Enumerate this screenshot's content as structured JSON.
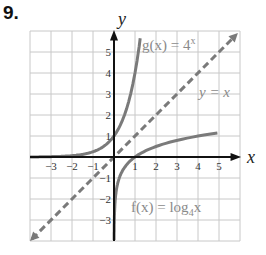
{
  "problem": {
    "number": "9."
  },
  "chart_data": {
    "type": "line",
    "title": "",
    "xlabel": "x",
    "ylabel": "y",
    "xlim": [
      -4,
      6
    ],
    "ylim": [
      -4,
      6
    ],
    "grid": true,
    "x_ticks": [
      "-3",
      "-2",
      "-1",
      "1",
      "2",
      "3",
      "4",
      "5"
    ],
    "y_ticks": [
      "5",
      "4",
      "3",
      "2",
      "1",
      "-1",
      "-2",
      "-3"
    ],
    "series": [
      {
        "name": "g(x) = 4^x",
        "style": "solid",
        "color": "#7a7a7a",
        "formula": "4^x"
      },
      {
        "name": "f(x) = log_4 x",
        "style": "solid",
        "color": "#7a7a7a",
        "formula": "log4(x)"
      },
      {
        "name": "y = x",
        "style": "dashed",
        "color": "#7a7a7a",
        "formula": "x"
      }
    ],
    "annotations": [
      {
        "text": "g(x) = 4^x",
        "position": "top-right"
      },
      {
        "text": "y = x",
        "position": "right"
      },
      {
        "text": "f(x) = log4x",
        "position": "bottom-right"
      }
    ]
  },
  "labels": {
    "x_axis": "x",
    "y_axis": "y",
    "g_label_prefix": "g(x) = 4",
    "g_label_exp": "x",
    "yx_label": "y = x",
    "f_label_prefix": "f(x) = log",
    "f_label_sub": "4",
    "f_label_suffix": "x"
  },
  "x_ticks": [
    {
      "v": -3,
      "label": "−3"
    },
    {
      "v": -2,
      "label": "−2"
    },
    {
      "v": -1,
      "label": "−1"
    },
    {
      "v": 1,
      "label": "1"
    },
    {
      "v": 2,
      "label": "2"
    },
    {
      "v": 3,
      "label": "3"
    },
    {
      "v": 4,
      "label": "4"
    },
    {
      "v": 5,
      "label": "5"
    }
  ],
  "y_ticks": [
    {
      "v": 5,
      "label": "5"
    },
    {
      "v": 4,
      "label": "4"
    },
    {
      "v": 3,
      "label": "3"
    },
    {
      "v": 2,
      "label": "2"
    },
    {
      "v": 1,
      "label": "1"
    },
    {
      "v": -1,
      "label": "−1"
    },
    {
      "v": -2,
      "label": "−2"
    },
    {
      "v": -3,
      "label": "−3"
    }
  ]
}
